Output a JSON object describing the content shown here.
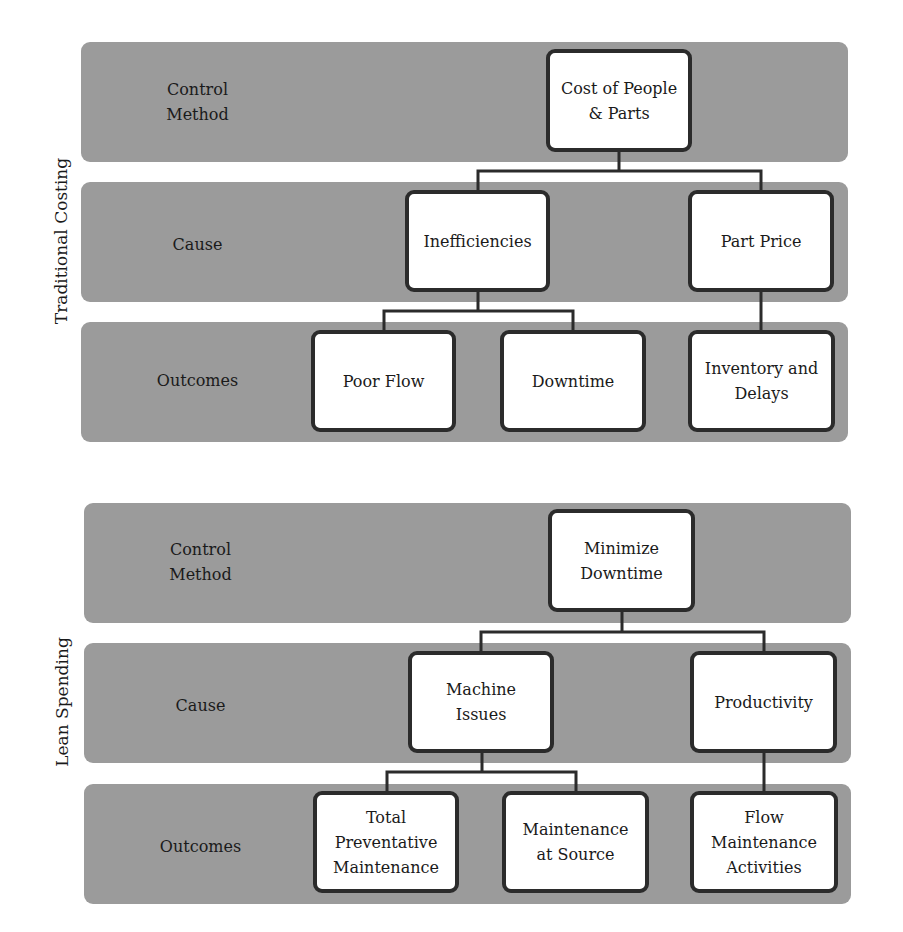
{
  "diagrams": [
    {
      "side_label": "Traditional Costing",
      "bands": [
        {
          "label": "Control\nMethod"
        },
        {
          "label": "Cause"
        },
        {
          "label": "Outcomes"
        }
      ],
      "nodes": {
        "control": "Cost of People\n& Parts",
        "cause_left": "Inefficiencies",
        "cause_right": "Part Price",
        "outcome_1": "Poor Flow",
        "outcome_2": "Downtime",
        "outcome_3": "Inventory and\nDelays"
      }
    },
    {
      "side_label": "Lean Spending",
      "bands": [
        {
          "label": "Control\nMethod"
        },
        {
          "label": "Cause"
        },
        {
          "label": "Outcomes"
        }
      ],
      "nodes": {
        "control": "Minimize\nDowntime",
        "cause_left": "Machine\nIssues",
        "cause_right": "Productivity",
        "outcome_1": "Total\nPreventative\nMaintenance",
        "outcome_2": "Maintenance\nat Source",
        "outcome_3": "Flow\nMaintenance\nActivities"
      }
    }
  ],
  "colors": {
    "band_fill": "#9b9b9b",
    "node_fill": "#ffffff",
    "node_border": "#2b2b2b"
  }
}
